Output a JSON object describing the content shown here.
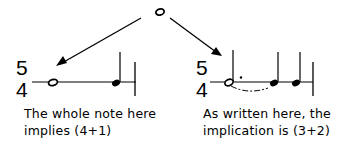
{
  "diagram": {
    "top_note": {
      "symbol": "whole-note"
    },
    "left_example": {
      "time_signature": {
        "numerator": "5",
        "denominator": "4"
      },
      "notes": [
        "whole note",
        "quarter note"
      ],
      "caption_line1": "The whole note here",
      "caption_line2": "implies (4+1)"
    },
    "right_example": {
      "time_signature": {
        "numerator": "5",
        "denominator": "4"
      },
      "notes": [
        "dotted half note",
        "quarter note",
        "quarter note"
      ],
      "caption_line1": "As written here, the",
      "caption_line2": "implication is (3+2)"
    },
    "colors": {
      "ink": "#000000",
      "background": "#ffffff"
    }
  }
}
